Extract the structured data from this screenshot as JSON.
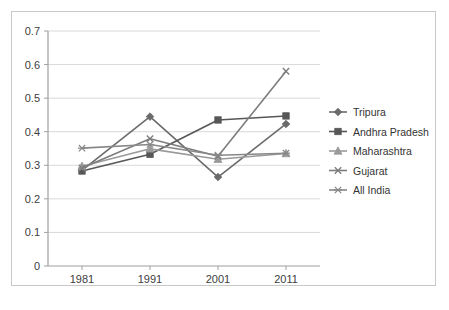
{
  "chart_data": {
    "type": "line",
    "title": "",
    "subtitle": "",
    "xlabel": "",
    "ylabel": "",
    "categories": [
      "1981",
      "1991",
      "2001",
      "2011"
    ],
    "x": [
      1981,
      1991,
      2001,
      2011
    ],
    "ylim": [
      0,
      0.7
    ],
    "yticks": [
      "0",
      "0.1",
      "0.2",
      "0.3",
      "0.4",
      "0.5",
      "0.6",
      "0.7"
    ],
    "ytick_values": [
      0,
      0.1,
      0.2,
      0.3,
      0.4,
      0.5,
      0.6,
      0.7
    ],
    "grid": "horizontal",
    "legend_position": "right",
    "series": [
      {
        "name": "Tripura",
        "marker": "diamond",
        "color": "#6b6b6b",
        "values": [
          0.285,
          0.445,
          0.265,
          0.423
        ]
      },
      {
        "name": "Andhra Pradesh",
        "marker": "square",
        "color": "#575757",
        "values": [
          0.283,
          0.333,
          0.435,
          0.447
        ]
      },
      {
        "name": "Maharashtra",
        "marker": "triangle",
        "color": "#9a9a9a",
        "values": [
          0.297,
          0.349,
          0.318,
          0.335
        ]
      },
      {
        "name": "Gujarat",
        "marker": "cross",
        "color": "#7d7d7d",
        "values": [
          0.292,
          0.379,
          0.327,
          0.58
        ]
      },
      {
        "name": "All India",
        "marker": "asterisk",
        "color": "#888888",
        "values": [
          0.351,
          0.362,
          0.33,
          0.336
        ]
      }
    ]
  },
  "axes": {
    "y_tick_labels": [
      "0.7",
      "0.6",
      "0.5",
      "0.4",
      "0.3",
      "0.2",
      "0.1",
      "0"
    ],
    "x_tick_labels": [
      "1981",
      "1991",
      "2001",
      "2011"
    ]
  },
  "legend": {
    "items": [
      {
        "label": "Tripura"
      },
      {
        "label": "Andhra Pradesh"
      },
      {
        "label": "Maharashtra"
      },
      {
        "label": "Gujarat"
      },
      {
        "label": "All India"
      }
    ]
  },
  "colors": {
    "frame": "#c8c8c8",
    "axis": "#a0a0a0",
    "grid": "#d9d9d9",
    "text": "#404040"
  }
}
